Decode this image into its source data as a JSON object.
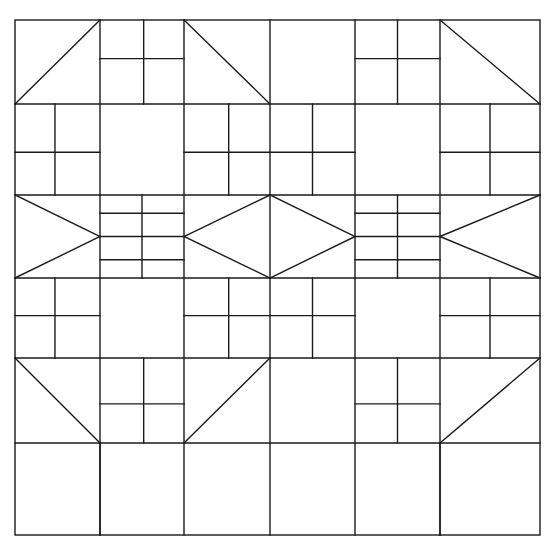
{
  "document": {
    "title": "Quilt Block Pattern Diagram",
    "kind": "line-drawing",
    "description": "Five-by-five grid patchwork quilt layout drawn as black outlines on white background",
    "background_color": "#ffffff",
    "line_color": "#1a1a1a",
    "line_width": 1.4,
    "canvas": {
      "width": 547,
      "height": 546
    }
  },
  "geometry": {
    "outer_frame": {
      "x": 15,
      "y": 20,
      "width": 525,
      "height": 515
    },
    "column_edges": [
      15,
      100,
      184,
      270,
      355,
      440,
      540
    ],
    "row_edges": [
      20,
      104,
      195,
      278,
      358,
      443,
      535
    ]
  },
  "grid": {
    "columns": 6,
    "rows": 6,
    "column_labels": [
      "C1",
      "C2",
      "C3",
      "C4",
      "C5",
      "C6"
    ],
    "row_labels": [
      "R1",
      "R2",
      "R3",
      "R4",
      "R5",
      "R6"
    ]
  },
  "legend": {
    "block_types": [
      {
        "key": "plain",
        "label": "Plain square"
      },
      {
        "key": "half-square-triangle",
        "label": "Half square triangle"
      },
      {
        "key": "four-patch",
        "label": "Four patch"
      },
      {
        "key": "flying-geese",
        "label": "Flying geese"
      },
      {
        "key": "diamond-in-square",
        "label": "Diamond in square"
      }
    ]
  },
  "blocks": [
    {
      "id": "r1c1",
      "row": 1,
      "col": 1,
      "type": "half-square-triangle",
      "diagonal": "bl-tr"
    },
    {
      "id": "r1c2",
      "row": 1,
      "col": 2,
      "type": "four-patch",
      "split_x": 0.52,
      "split_y": 0.46
    },
    {
      "id": "r1c3",
      "row": 1,
      "col": 3,
      "type": "half-square-triangle",
      "diagonal": "tl-br"
    },
    {
      "id": "r1c4",
      "row": 1,
      "col": 4,
      "type": "plain"
    },
    {
      "id": "r1c5",
      "row": 1,
      "col": 5,
      "type": "four-patch",
      "split_x": 0.5,
      "split_y": 0.46
    },
    {
      "id": "r1c6",
      "row": 1,
      "col": 6,
      "type": "half-square-triangle",
      "diagonal": "tl-br"
    },
    {
      "id": "r2c1",
      "row": 2,
      "col": 1,
      "type": "four-patch",
      "split_x": 0.47,
      "split_y": 0.53
    },
    {
      "id": "r2c2",
      "row": 2,
      "col": 2,
      "type": "plain"
    },
    {
      "id": "r2c3",
      "row": 2,
      "col": 3,
      "type": "four-patch",
      "split_x": 0.52,
      "split_y": 0.53
    },
    {
      "id": "r2c4",
      "row": 2,
      "col": 4,
      "type": "four-patch",
      "split_x": 0.5,
      "split_y": 0.53
    },
    {
      "id": "r2c5",
      "row": 2,
      "col": 5,
      "type": "plain"
    },
    {
      "id": "r2c6",
      "row": 2,
      "col": 6,
      "type": "four-patch",
      "split_x": 0.5,
      "split_y": 0.53
    },
    {
      "id": "r3c1",
      "row": 3,
      "col": 1,
      "type": "flying-geese",
      "point": "right"
    },
    {
      "id": "r3c2",
      "row": 3,
      "col": 2,
      "type": "four-patch",
      "split_x": 0.5,
      "split_y": 0.5,
      "inner_bar": true
    },
    {
      "id": "r3c3",
      "row": 3,
      "col": 3,
      "type": "diamond-in-square",
      "half": "left"
    },
    {
      "id": "r3c4",
      "row": 3,
      "col": 4,
      "type": "diamond-in-square",
      "half": "right"
    },
    {
      "id": "r3c5",
      "row": 3,
      "col": 5,
      "type": "four-patch",
      "split_x": 0.5,
      "split_y": 0.5,
      "inner_bar": true
    },
    {
      "id": "r3c6",
      "row": 3,
      "col": 6,
      "type": "flying-geese",
      "point": "left"
    },
    {
      "id": "r4c1",
      "row": 4,
      "col": 1,
      "type": "four-patch",
      "split_x": 0.47,
      "split_y": 0.47
    },
    {
      "id": "r4c2",
      "row": 4,
      "col": 2,
      "type": "plain"
    },
    {
      "id": "r4c3",
      "row": 4,
      "col": 3,
      "type": "four-patch",
      "split_x": 0.52,
      "split_y": 0.47
    },
    {
      "id": "r4c4",
      "row": 4,
      "col": 4,
      "type": "four-patch",
      "split_x": 0.5,
      "split_y": 0.47
    },
    {
      "id": "r4c5",
      "row": 4,
      "col": 5,
      "type": "plain"
    },
    {
      "id": "r4c6",
      "row": 4,
      "col": 6,
      "type": "four-patch",
      "split_x": 0.5,
      "split_y": 0.47
    },
    {
      "id": "r5c1",
      "row": 5,
      "col": 1,
      "type": "half-square-triangle",
      "diagonal": "tl-br"
    },
    {
      "id": "r5c2",
      "row": 5,
      "col": 2,
      "type": "four-patch",
      "split_x": 0.52,
      "split_y": 0.54
    },
    {
      "id": "r5c3",
      "row": 5,
      "col": 3,
      "type": "half-square-triangle",
      "diagonal": "bl-tr"
    },
    {
      "id": "r5c4",
      "row": 5,
      "col": 4,
      "type": "plain"
    },
    {
      "id": "r5c5",
      "row": 5,
      "col": 5,
      "type": "four-patch",
      "split_x": 0.5,
      "split_y": 0.54
    },
    {
      "id": "r5c6",
      "row": 5,
      "col": 6,
      "type": "half-square-triangle",
      "diagonal": "bl-tr"
    }
  ],
  "extra_lines": [
    {
      "name": "bottom-row-mid-vertical-left",
      "x1": 100,
      "y1": 443,
      "x2": 100,
      "y2": 535
    },
    {
      "name": "bottom-row-mid-vertical-right",
      "x1": 440,
      "y1": 443,
      "x2": 440,
      "y2": 535
    }
  ]
}
